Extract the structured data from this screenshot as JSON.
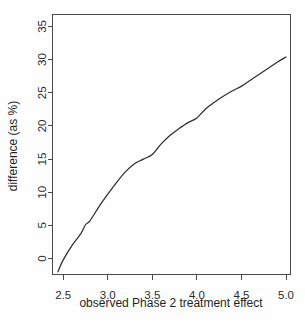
{
  "figure": {
    "background_color": "#fefefe",
    "frame_color": "#4a4a4a",
    "curve_color": "#2e2e2e"
  },
  "chart_data": {
    "type": "line",
    "title": "",
    "xlabel": "observed Phase 2 treatment effect",
    "ylabel": "difference (as %)",
    "xlim": [
      2.38,
      5.05
    ],
    "ylim": [
      -2.4,
      36.8
    ],
    "xticks": [
      2.5,
      3.0,
      3.5,
      4.0,
      4.5,
      5.0
    ],
    "xtick_labels": [
      "2.5",
      "3.0",
      "3.5",
      "4.0",
      "4.5",
      "5.0"
    ],
    "yticks": [
      0,
      5,
      10,
      15,
      20,
      25,
      30,
      35
    ],
    "ytick_labels": [
      "0",
      "5",
      "10",
      "15",
      "20",
      "25",
      "30",
      "35"
    ],
    "grid": false,
    "legend": false,
    "series": [
      {
        "name": "difference",
        "x": [
          2.44,
          2.5,
          2.6,
          2.7,
          2.75,
          2.8,
          2.9,
          3.0,
          3.1,
          3.2,
          3.3,
          3.4,
          3.5,
          3.6,
          3.7,
          3.8,
          3.9,
          4.0,
          4.1,
          4.2,
          4.3,
          4.4,
          4.5,
          4.6,
          4.7,
          4.8,
          4.9,
          5.0
        ],
        "y": [
          -2.0,
          -0.2,
          2.0,
          3.8,
          5.1,
          5.7,
          7.8,
          9.7,
          11.5,
          13.1,
          14.3,
          15.0,
          15.7,
          17.3,
          18.6,
          19.6,
          20.5,
          21.2,
          22.6,
          23.6,
          24.5,
          25.3,
          26.0,
          26.9,
          27.8,
          28.7,
          29.6,
          30.4
        ]
      }
    ]
  },
  "axis_titles": {
    "x": "observed Phase 2 treatment effect",
    "y": "difference (as %)"
  }
}
